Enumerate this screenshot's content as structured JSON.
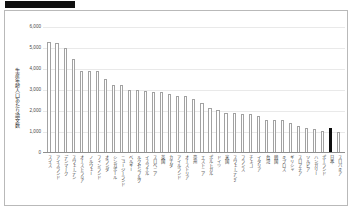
{
  "header": {
    "redaction_label": ""
  },
  "chart_data": {
    "type": "bar",
    "title": "",
    "xlabel": "",
    "ylabel": "生産年齢人口あたり論文数",
    "ylim": [
      0,
      6000
    ],
    "ytick_labels": [
      "6,000",
      "5,000",
      "4,000",
      "3,000",
      "2,000",
      "1,000",
      "0"
    ],
    "ytick_values": [
      6000,
      5000,
      4000,
      3000,
      2000,
      1000,
      0
    ],
    "grid": true,
    "legend": "none",
    "highlight_category": "日本",
    "highlight_color": "#0d0d0d",
    "bar_color": "#ffffff",
    "bar_border_color": "#a2a2a2",
    "categories": [
      "スイス",
      "アイスランド",
      "デンマーク",
      "スウェーデン",
      "オーストラリア",
      "ノルウェー",
      "フィンランド",
      "オランダ",
      "シンガポール",
      "ニュージーランド",
      "ベルギー",
      "ルクセンブルク",
      "イスラエル",
      "スロベニア",
      "英国",
      "カナダ",
      "アイルランド",
      "オーストリア",
      "豪州",
      "エストニア",
      "ポルトガル",
      "ドイツ",
      "米国",
      "スウェーデン2",
      "フランス",
      "チェコ",
      "イタリア",
      "台湾",
      "韓国",
      "キプロス",
      "ギリシャ",
      "スロアチア",
      "ソルビア",
      "ハンガリー",
      "ポーランド",
      "日本",
      "スロバキア"
    ],
    "values": [
      5240,
      5190,
      4950,
      4420,
      3870,
      3870,
      3840,
      3500,
      3200,
      3170,
      2960,
      2950,
      2900,
      2880,
      2860,
      2740,
      2690,
      2680,
      2510,
      2350,
      2110,
      2010,
      1880,
      1850,
      1800,
      1790,
      1710,
      1510,
      1510,
      1510,
      1400,
      1250,
      1130,
      1080,
      1010,
      1150,
      970
    ]
  }
}
